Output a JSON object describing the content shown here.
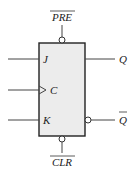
{
  "diagram": {
    "colors": {
      "box_fill": "#ececec",
      "stroke": "#222222",
      "background": "#ffffff"
    },
    "inputs": [
      {
        "label": "J",
        "y": 59
      },
      {
        "label": "C",
        "y": 90,
        "clock": true
      },
      {
        "label": "K",
        "y": 120
      }
    ],
    "outputs": [
      {
        "label": "Q",
        "y": 59,
        "inverted": false
      },
      {
        "label": "Q",
        "y": 120,
        "inverted": true,
        "overline": true
      }
    ],
    "preset": {
      "label": "PRE",
      "overline": true,
      "active_low": true
    },
    "clear": {
      "label": "CLR",
      "overline": true,
      "active_low": true
    }
  }
}
